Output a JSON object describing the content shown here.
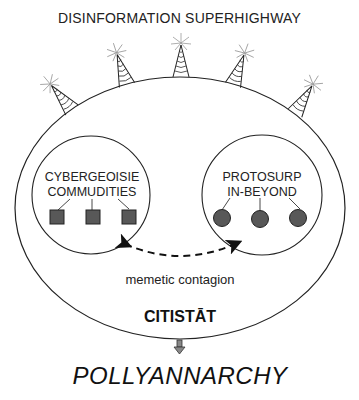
{
  "title": "DISINFORMATION SUPERHIGHWAY",
  "left_group": {
    "line1": "CYBERGEOISIE",
    "line2": "COMMUDITIES",
    "marker_shape": "square",
    "marker_count": 3,
    "marker_color": "#555555"
  },
  "right_group": {
    "line1": "PROTOSURP",
    "line2": "IN-BEYOND",
    "marker_shape": "circle",
    "marker_count": 3,
    "marker_color": "#555555"
  },
  "link_label": "memetic contagion",
  "container_label": "CITISTĀT",
  "outcome_label": "POLLYANNARCHY",
  "towers": {
    "count": 5,
    "icon": "radio-tower-icon"
  }
}
